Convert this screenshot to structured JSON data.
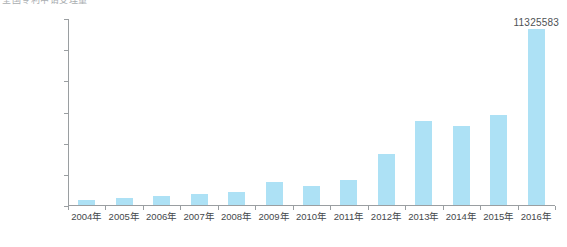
{
  "chart_data": {
    "type": "bar",
    "title": "全国专利申请受理量",
    "subtitle": "",
    "xlabel": "",
    "ylabel": "",
    "grid": false,
    "legend": null,
    "ylim": [
      0,
      12000000
    ],
    "categories": [
      "2004年",
      "2005年",
      "2006年",
      "2007年",
      "2008年",
      "2009年",
      "2010年",
      "2011年",
      "2012年",
      "2013年",
      "2014年",
      "2015年",
      "2016年"
    ],
    "values": [
      353807,
      476264,
      573178,
      694153,
      828328,
      1458481,
      1222286,
      1633347,
      3255271,
      5377778,
      5099884,
      5793692,
      11325583
    ],
    "bar_color": "#ade1f5",
    "axis_color": "#9a9ea1",
    "ytick_labels": [
      "12 000000",
      "10 000000",
      "80 00000",
      "60 00000",
      "4 000000",
      "2 000000",
      "0"
    ],
    "ytick_values": [
      12000000,
      10000000,
      8000000,
      6000000,
      4000000,
      2000000,
      0
    ],
    "data_labels": [
      {
        "category": "2016年",
        "text": "11325583",
        "value": 11325583
      }
    ]
  }
}
